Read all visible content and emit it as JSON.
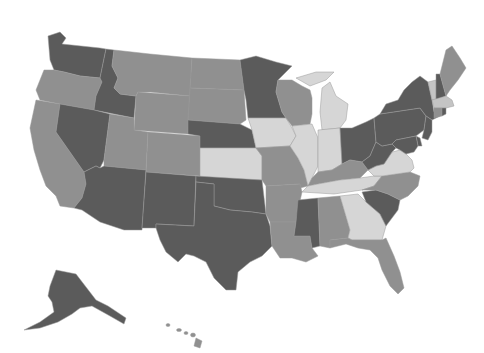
{
  "caption": {
    "text": "",
    "note": "caption text cut off at top edge; only descenders visible"
  },
  "map": {
    "type": "choropleth",
    "region": "United States",
    "colors": {
      "dark": "#5b5b5b",
      "medium": "#909090",
      "light": "#c4c4c4",
      "lightest": "#d6d6d6"
    },
    "states": [
      {
        "id": "WA",
        "shade": "dark"
      },
      {
        "id": "OR",
        "shade": "medium"
      },
      {
        "id": "CA",
        "shade": "medium"
      },
      {
        "id": "ID",
        "shade": "dark"
      },
      {
        "id": "NV",
        "shade": "dark"
      },
      {
        "id": "MT",
        "shade": "medium"
      },
      {
        "id": "WY",
        "shade": "medium"
      },
      {
        "id": "UT",
        "shade": "medium"
      },
      {
        "id": "AZ",
        "shade": "dark"
      },
      {
        "id": "CO",
        "shade": "medium"
      },
      {
        "id": "NM",
        "shade": "dark"
      },
      {
        "id": "ND",
        "shade": "medium"
      },
      {
        "id": "SD",
        "shade": "medium"
      },
      {
        "id": "NE",
        "shade": "dark"
      },
      {
        "id": "KS",
        "shade": "lightest"
      },
      {
        "id": "OK",
        "shade": "dark"
      },
      {
        "id": "TX",
        "shade": "dark"
      },
      {
        "id": "MN",
        "shade": "dark"
      },
      {
        "id": "IA",
        "shade": "lightest"
      },
      {
        "id": "MO",
        "shade": "medium"
      },
      {
        "id": "AR",
        "shade": "medium"
      },
      {
        "id": "LA",
        "shade": "medium"
      },
      {
        "id": "WI",
        "shade": "medium"
      },
      {
        "id": "IL",
        "shade": "lightest"
      },
      {
        "id": "MI",
        "shade": "lightest"
      },
      {
        "id": "IN",
        "shade": "lightest"
      },
      {
        "id": "OH",
        "shade": "dark"
      },
      {
        "id": "KY",
        "shade": "medium"
      },
      {
        "id": "TN",
        "shade": "lightest"
      },
      {
        "id": "MS",
        "shade": "dark"
      },
      {
        "id": "AL",
        "shade": "medium"
      },
      {
        "id": "GA",
        "shade": "lightest"
      },
      {
        "id": "FL",
        "shade": "medium"
      },
      {
        "id": "SC",
        "shade": "dark"
      },
      {
        "id": "NC",
        "shade": "medium"
      },
      {
        "id": "VA",
        "shade": "lightest"
      },
      {
        "id": "WV",
        "shade": "dark"
      },
      {
        "id": "PA",
        "shade": "dark"
      },
      {
        "id": "NY",
        "shade": "dark"
      },
      {
        "id": "VT",
        "shade": "light"
      },
      {
        "id": "NH",
        "shade": "dark"
      },
      {
        "id": "ME",
        "shade": "medium"
      },
      {
        "id": "MA",
        "shade": "light"
      },
      {
        "id": "CT",
        "shade": "medium"
      },
      {
        "id": "RI",
        "shade": "dark"
      },
      {
        "id": "NJ",
        "shade": "dark"
      },
      {
        "id": "DE",
        "shade": "dark"
      },
      {
        "id": "MD",
        "shade": "dark"
      },
      {
        "id": "AK",
        "shade": "dark"
      },
      {
        "id": "HI",
        "shade": "medium"
      }
    ]
  }
}
